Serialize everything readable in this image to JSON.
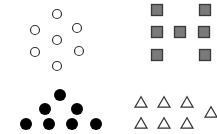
{
  "canvas": {
    "width": 217,
    "height": 134,
    "background": "#ffffff"
  },
  "groups": {
    "open_circles": {
      "count": 7,
      "stroke": "#333333",
      "radius": 4.5,
      "points": [
        [
          57,
          14
        ],
        [
          35,
          30
        ],
        [
          77,
          28
        ],
        [
          57,
          40
        ],
        [
          35,
          52
        ],
        [
          79,
          51
        ],
        [
          57,
          66
        ]
      ]
    },
    "gray_squares": {
      "count": 7,
      "fill": "#7a7a7a",
      "stroke": "#3a3a3a",
      "size": 11,
      "points": [
        [
          157,
          10
        ],
        [
          205,
          10
        ],
        [
          157,
          32
        ],
        [
          180,
          32
        ],
        [
          204,
          32
        ],
        [
          157,
          55
        ],
        [
          205,
          55
        ]
      ]
    },
    "black_dots": {
      "count": 7,
      "fill": "#000000",
      "radius": 6,
      "points": [
        [
          60,
          95
        ],
        [
          45,
          109
        ],
        [
          77,
          109
        ],
        [
          26,
          124
        ],
        [
          49,
          124
        ],
        [
          72,
          124
        ],
        [
          96,
          124
        ]
      ]
    },
    "open_triangles": {
      "count": 7,
      "stroke": "#333333",
      "size": 12,
      "points": [
        [
          141,
          102
        ],
        [
          164,
          102
        ],
        [
          187,
          102
        ],
        [
          141,
          123
        ],
        [
          164,
          123
        ],
        [
          187,
          123
        ],
        [
          211,
          112
        ]
      ]
    }
  }
}
